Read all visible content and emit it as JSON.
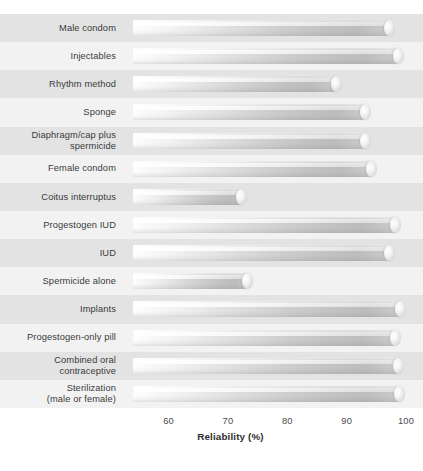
{
  "chart_data": {
    "type": "bar",
    "orientation": "horizontal",
    "title": "",
    "subtitle": "",
    "xlabel": "Reliability (%)",
    "ylabel": "",
    "xlim": [
      54,
      100
    ],
    "xticks": [
      60,
      70,
      80,
      90,
      100
    ],
    "xticklabels": [
      "60",
      "70",
      "80",
      "90",
      "100"
    ],
    "grid": true,
    "legend": null,
    "bar_start_value": 54,
    "categories": [
      "Male condom",
      "Injectables",
      "Rhythm method",
      "Sponge",
      "Diaphragm/cap plus\nspermicide",
      "Female condom",
      "Coitus interruptus",
      "Progestogen IUD",
      "IUD",
      "Spermicide alone",
      "Implants",
      "Progestogen-only pill",
      "Combined oral\ncontraceptive",
      "Sterilization\n(male or female)"
    ],
    "values": [
      98,
      99.5,
      89,
      94,
      94,
      95,
      73,
      99,
      98,
      74,
      99.8,
      99,
      99.5,
      99.6
    ]
  },
  "axis": {
    "title": "Reliability (%)"
  },
  "rows": [
    {
      "label": "Male condom",
      "value": 98
    },
    {
      "label": "Injectables",
      "value": 99.5
    },
    {
      "label": "Rhythm method",
      "value": 89
    },
    {
      "label": "Sponge",
      "value": 94
    },
    {
      "label": "Diaphragm/cap plus\nspermicide",
      "value": 94
    },
    {
      "label": "Female condom",
      "value": 95
    },
    {
      "label": "Coitus interruptus",
      "value": 73
    },
    {
      "label": "Progestogen IUD",
      "value": 99
    },
    {
      "label": "IUD",
      "value": 98
    },
    {
      "label": "Spermicide alone",
      "value": 74
    },
    {
      "label": "Implants",
      "value": 99.8
    },
    {
      "label": "Progestogen-only pill",
      "value": 99
    },
    {
      "label": "Combined oral\ncontraceptive",
      "value": 99.5
    },
    {
      "label": "Sterilization\n(male or female)",
      "value": 99.6
    }
  ]
}
